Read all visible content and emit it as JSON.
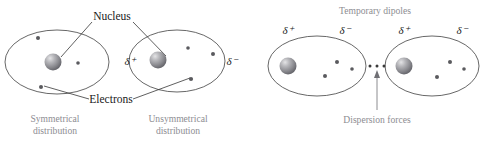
{
  "figure": {
    "title_caption": "Temporary dipoles",
    "background_color": "#ffffff",
    "label_color": "#1a1a1a",
    "caption_color": "#8d8d92",
    "outline_color": "#4b4b4b",
    "nucleus_color": "#808085",
    "electron_color": "#5a5a5e"
  },
  "labels": {
    "nucleus": "Nucleus",
    "electrons": "Electrons",
    "temporary_dipoles": "Temporary dipoles",
    "dispersion_forces": "Dispersion forces",
    "symmetrical_distribution_line1": "Symmetrical",
    "symmetrical_distribution_line2": "distribution",
    "unsymmetrical_distribution_line1": "Unsymmetrical",
    "unsymmetrical_distribution_line2": "distribution",
    "delta_positive": "δ⁺",
    "delta_negative": "δ⁻"
  },
  "panels": [
    {
      "id": "left-panel",
      "name": "symmetrical-vs-unsymmetrical",
      "atoms": [
        {
          "id": "atom-symmetrical",
          "name": "symmetrical-atom",
          "caption_line1": "Symmetrical",
          "caption_line2": "distribution",
          "nucleus": {
            "cx": 53,
            "cy": 62,
            "r": 8.5
          },
          "electrons": [
            {
              "cx": 38,
              "cy": 38,
              "r": 2.0
            },
            {
              "cx": 78,
              "cy": 63,
              "r": 1.8
            },
            {
              "cx": 41,
              "cy": 87,
              "r": 2.0
            }
          ],
          "charges": []
        },
        {
          "id": "atom-unsymmetrical",
          "name": "unsymmetrical-atom",
          "caption_line1": "Unsymmetrical",
          "caption_line2": "distribution",
          "nucleus": {
            "cx": 158,
            "cy": 60,
            "r": 8.5
          },
          "electrons": [
            {
              "cx": 188,
              "cy": 48,
              "r": 1.8
            },
            {
              "cx": 213,
              "cy": 54,
              "r": 2.0
            },
            {
              "cx": 191,
              "cy": 79,
              "r": 2.1
            }
          ],
          "charges": [
            {
              "sign": "δ⁺",
              "x": 130,
              "y": 61
            },
            {
              "sign": "δ⁻",
              "x": 222,
              "y": 61
            }
          ]
        }
      ]
    },
    {
      "id": "right-panel",
      "name": "temporary-dipoles-pair",
      "header": "Temporary dipoles",
      "footer": "Dispersion forces",
      "atoms": [
        {
          "id": "atom-dipole-left",
          "name": "dipole-atom-left",
          "nucleus": {
            "cx": 288,
            "cy": 66,
            "r": 8.5
          },
          "electrons": [
            {
              "cx": 337,
              "cy": 62,
              "r": 2.0
            },
            {
              "cx": 325,
              "cy": 76,
              "r": 2.0
            },
            {
              "cx": 352,
              "cy": 69,
              "r": 1.8
            }
          ],
          "charges": [
            {
              "sign": "δ⁺",
              "x": 288,
              "y": 30
            },
            {
              "sign": "δ⁻",
              "x": 345,
              "y": 30
            }
          ]
        },
        {
          "id": "atom-dipole-right",
          "name": "dipole-atom-right",
          "nucleus": {
            "cx": 404,
            "cy": 66,
            "r": 8.5
          },
          "electrons": [
            {
              "cx": 450,
              "cy": 62,
              "r": 2.0
            },
            {
              "cx": 437,
              "cy": 77,
              "r": 2.0
            },
            {
              "cx": 464,
              "cy": 69,
              "r": 1.8
            }
          ],
          "charges": [
            {
              "sign": "δ⁺",
              "x": 404,
              "y": 30
            },
            {
              "sign": "δ⁻",
              "x": 460,
              "y": 30
            }
          ]
        }
      ],
      "force_dots": [
        {
          "cx": 370,
          "cy": 66,
          "r": 1.5
        },
        {
          "cx": 377,
          "cy": 66,
          "r": 1.5
        },
        {
          "cx": 384,
          "cy": 66,
          "r": 1.5
        }
      ]
    }
  ]
}
